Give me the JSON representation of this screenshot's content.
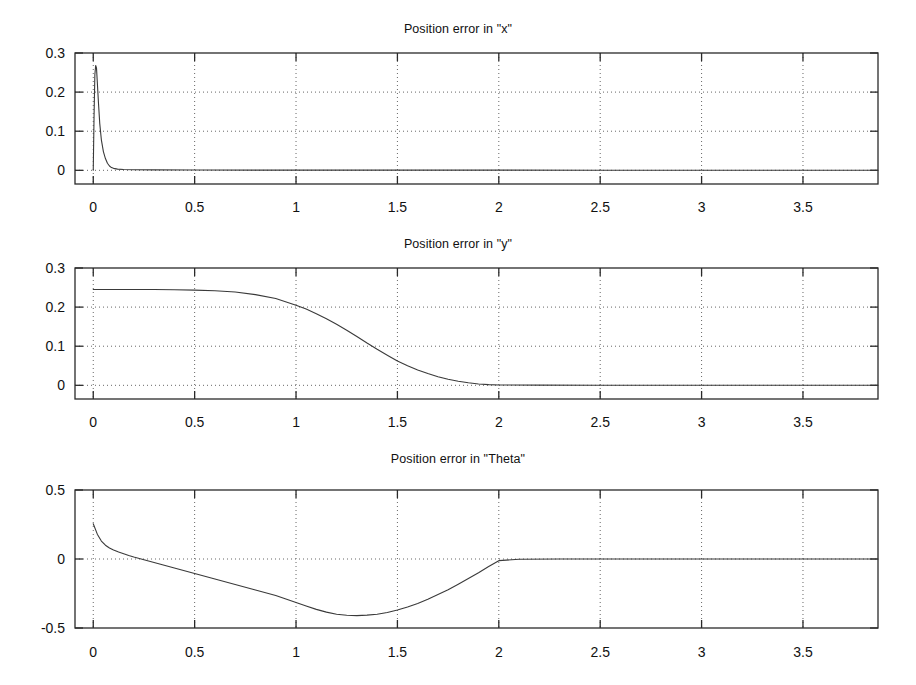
{
  "figure": {
    "background": "#ffffff",
    "foreground": "#1a1a1a",
    "panel_count": 3
  },
  "chart_data": [
    {
      "id": "position-error-x",
      "type": "line",
      "title": "Position error in \"x\"",
      "xlabel": "",
      "ylabel": "",
      "xlim": [
        -0.09,
        3.87
      ],
      "ylim": [
        -0.035,
        0.3
      ],
      "grid": true,
      "grid_style": "dotted",
      "legend": null,
      "xticks": [
        0,
        0.5,
        1,
        1.5,
        2,
        2.5,
        3,
        3.5
      ],
      "xticklabels": [
        "0",
        "0.5",
        "1",
        "1.5",
        "2",
        "2.5",
        "3",
        "3.5"
      ],
      "yticks": [
        0,
        0.1,
        0.2,
        0.3
      ],
      "yticklabels": [
        "0",
        "0.1",
        "0.2",
        "0.3"
      ],
      "series": [
        {
          "name": "error x",
          "x": [
            0,
            0.004,
            0.008,
            0.012,
            0.016,
            0.02,
            0.026,
            0.032,
            0.04,
            0.05,
            0.06,
            0.07,
            0.08,
            0.09,
            0.1,
            0.12,
            0.15,
            0.2,
            0.3,
            0.5,
            0.8,
            1.2,
            1.6,
            2.0,
            2.5,
            3.0,
            3.5,
            3.87
          ],
          "y": [
            0.0,
            0.14,
            0.245,
            0.268,
            0.262,
            0.225,
            0.17,
            0.12,
            0.078,
            0.048,
            0.03,
            0.018,
            0.011,
            0.007,
            0.005,
            0.003,
            0.002,
            0.0015,
            0.001,
            0.0008,
            0.0006,
            0.0005,
            0.0004,
            0.0004,
            0.0003,
            0.0003,
            0.0002,
            0.0002
          ]
        }
      ],
      "annotations": [
        "initial transient spike to approx 0.27 near t = 0.01, settles to 0"
      ]
    },
    {
      "id": "position-error-y",
      "type": "line",
      "title": "Position error in \"y\"",
      "xlabel": "",
      "ylabel": "",
      "xlim": [
        -0.09,
        3.87
      ],
      "ylim": [
        -0.035,
        0.3
      ],
      "grid": true,
      "grid_style": "dotted",
      "legend": null,
      "xticks": [
        0,
        0.5,
        1,
        1.5,
        2,
        2.5,
        3,
        3.5
      ],
      "xticklabels": [
        "0",
        "0.5",
        "1",
        "1.5",
        "2",
        "2.5",
        "3",
        "3.5"
      ],
      "yticks": [
        0,
        0.1,
        0.2,
        0.3
      ],
      "yticklabels": [
        "0",
        "0.1",
        "0.2",
        "0.3"
      ],
      "series": [
        {
          "name": "error y",
          "x": [
            0,
            0.1,
            0.2,
            0.3,
            0.4,
            0.5,
            0.6,
            0.7,
            0.8,
            0.9,
            1.0,
            1.05,
            1.1,
            1.15,
            1.2,
            1.25,
            1.3,
            1.35,
            1.4,
            1.45,
            1.5,
            1.55,
            1.6,
            1.65,
            1.7,
            1.75,
            1.8,
            1.85,
            1.9,
            1.95,
            2.0,
            2.2,
            2.5,
            3.0,
            3.5,
            3.87
          ],
          "y": [
            0.245,
            0.245,
            0.245,
            0.245,
            0.2445,
            0.2435,
            0.242,
            0.2385,
            0.232,
            0.222,
            0.205,
            0.195,
            0.183,
            0.17,
            0.156,
            0.141,
            0.125,
            0.108,
            0.092,
            0.077,
            0.062,
            0.05,
            0.039,
            0.03,
            0.022,
            0.0155,
            0.0105,
            0.0065,
            0.0035,
            0.0018,
            0.0008,
            0.0004,
            0.0003,
            0.0003,
            0.0002,
            0.0002
          ]
        }
      ],
      "annotations": [
        "smooth sigmoid decay from 0.245 to 0 between t = 0.5 and t = 2"
      ]
    },
    {
      "id": "position-error-theta",
      "type": "line",
      "title": "Position error in \"Theta\"",
      "xlabel": "",
      "ylabel": "",
      "xlim": [
        -0.09,
        3.87
      ],
      "ylim": [
        -0.5,
        0.5
      ],
      "grid": true,
      "grid_style": "dotted",
      "legend": null,
      "xticks": [
        0,
        0.5,
        1,
        1.5,
        2,
        2.5,
        3,
        3.5
      ],
      "xticklabels": [
        "0",
        "0.5",
        "1",
        "1.5",
        "2",
        "2.5",
        "3",
        "3.5"
      ],
      "yticks": [
        -0.5,
        0,
        0.5
      ],
      "yticklabels": [
        "-0.5",
        "0",
        "0.5"
      ],
      "series": [
        {
          "name": "error theta",
          "x": [
            0,
            0.02,
            0.04,
            0.06,
            0.08,
            0.1,
            0.125,
            0.15,
            0.175,
            0.2,
            0.25,
            0.3,
            0.35,
            0.4,
            0.5,
            0.6,
            0.7,
            0.8,
            0.9,
            1.0,
            1.05,
            1.1,
            1.15,
            1.2,
            1.25,
            1.3,
            1.35,
            1.4,
            1.45,
            1.5,
            1.55,
            1.6,
            1.65,
            1.7,
            1.75,
            1.8,
            1.85,
            1.9,
            1.95,
            2.0,
            2.1,
            2.3,
            2.6,
            3.0,
            3.5,
            3.87
          ],
          "y": [
            0.255,
            0.18,
            0.13,
            0.1,
            0.08,
            0.065,
            0.05,
            0.038,
            0.026,
            0.015,
            -0.005,
            -0.025,
            -0.045,
            -0.065,
            -0.105,
            -0.145,
            -0.185,
            -0.225,
            -0.265,
            -0.315,
            -0.34,
            -0.365,
            -0.385,
            -0.4,
            -0.408,
            -0.41,
            -0.407,
            -0.4,
            -0.388,
            -0.37,
            -0.348,
            -0.322,
            -0.292,
            -0.258,
            -0.222,
            -0.183,
            -0.142,
            -0.1,
            -0.055,
            -0.012,
            -0.002,
            0.0,
            0.0,
            0.0,
            0.0,
            0.0
          ]
        }
      ],
      "annotations": [
        "initial positive value 0.25, dips to minimum approx -0.41 near t = 1.2, returns to 0 at t = 2"
      ]
    }
  ]
}
